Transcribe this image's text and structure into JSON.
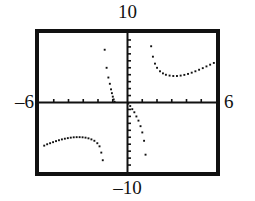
{
  "window": {
    "title": "graphing-calculator-viewport",
    "xmin_label": "–6",
    "xmax_label": "6",
    "ymax_label": "10",
    "ymin_label": "–10"
  },
  "chart_data": {
    "type": "scatter",
    "title": "",
    "subtitle": "",
    "xlabel": "",
    "ylabel": "",
    "xlim": [
      -6,
      6
    ],
    "ylim": [
      -10,
      10
    ],
    "grid": false,
    "legend": null,
    "axis_style": "crosshair-with-ticks",
    "x_tick_interval": 1,
    "y_tick_interval": 1,
    "x_ticks": [
      -5,
      -4,
      -3,
      -2,
      -1,
      1,
      2,
      3,
      4,
      5
    ],
    "y_ticks": [
      -9,
      -8,
      -7,
      -6,
      -5,
      -4,
      -3,
      -2,
      -1,
      1,
      2,
      3,
      4,
      5,
      6,
      7,
      8,
      9
    ],
    "render": "dotted-pixel-plot",
    "marker_color": "#111111",
    "asymptotes_x": [
      -0.95,
      1.45
    ],
    "series": [
      {
        "name": "branch-lower-left",
        "x": [
          -5.65,
          -5.45,
          -5.25,
          -5.05,
          -4.85,
          -4.65,
          -4.45,
          -4.25,
          -4.05,
          -3.85,
          -3.65,
          -3.45,
          -3.25,
          -3.05,
          -2.85,
          -2.65,
          -2.45,
          -2.25,
          -2.05,
          -1.9,
          -1.78,
          -1.68
        ],
        "y": [
          -6.2,
          -6.0,
          -5.85,
          -5.7,
          -5.55,
          -5.42,
          -5.3,
          -5.2,
          -5.12,
          -5.05,
          -5.0,
          -4.98,
          -4.98,
          -5.0,
          -5.05,
          -5.15,
          -5.3,
          -5.5,
          -5.85,
          -6.3,
          -7.2,
          -8.3
        ]
      },
      {
        "name": "branch-middle-left-of-asymptote",
        "x": [
          -1.55,
          -1.42,
          -1.3,
          -1.2,
          -1.12,
          -1.06,
          -1.0,
          -0.94,
          -0.88
        ],
        "y": [
          7.6,
          5.0,
          3.6,
          2.7,
          1.9,
          1.35,
          0.85,
          0.45,
          0.1
        ]
      },
      {
        "name": "branch-middle-right-of-origin",
        "x": [
          0.05,
          0.18,
          0.32,
          0.46,
          0.6,
          0.74,
          0.88,
          1.0,
          1.12,
          1.22
        ],
        "y": [
          -0.15,
          -0.5,
          -0.95,
          -1.4,
          -2.0,
          -2.6,
          -3.4,
          -4.3,
          -5.5,
          -7.5
        ]
      },
      {
        "name": "branch-upper-right",
        "x": [
          1.6,
          1.72,
          1.86,
          2.0,
          2.2,
          2.4,
          2.6,
          2.85,
          3.1,
          3.35,
          3.6,
          3.85,
          4.1,
          4.35,
          4.6,
          4.85,
          5.1,
          5.35,
          5.6,
          5.85
        ],
        "y": [
          8.1,
          6.6,
          5.6,
          5.0,
          4.5,
          4.2,
          4.0,
          3.88,
          3.82,
          3.82,
          3.88,
          3.98,
          4.12,
          4.3,
          4.5,
          4.72,
          4.95,
          5.2,
          5.45,
          5.7
        ]
      }
    ]
  }
}
